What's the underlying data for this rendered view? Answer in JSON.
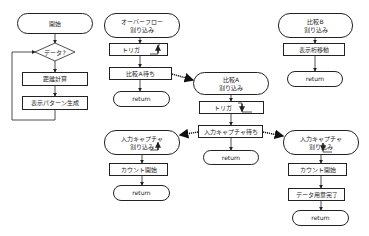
{
  "diagram": {
    "type": "flowchart",
    "colors": {
      "line": "#222222",
      "background": "#ffffff",
      "dotted_arrow": "#222222"
    },
    "main_flow": {
      "start": "開始",
      "decision": "データ?",
      "steps": [
        "距離計算",
        "表示パターン生成"
      ]
    },
    "overflow_isr": {
      "title": "オーバーフロー\n割り込み",
      "trigger": "トリガ",
      "wait": "比較A待ち",
      "end": "return"
    },
    "compare_a_isr": {
      "title": "比較A\n割り込み",
      "trigger": "トリガ",
      "wait": "入力キャプチャ待ち",
      "end": "return"
    },
    "compare_b_isr": {
      "title": "比較B\n割り込み",
      "step": "表示桁移動",
      "end": "return"
    },
    "capture_isr_left": {
      "title": "入力キャプチャ\n割り込み",
      "step": "カウント開始",
      "end": "return"
    },
    "capture_isr_right": {
      "title": "入力キャプチャ\n割り込み",
      "steps": [
        "カウント開始",
        "データ用意完了"
      ],
      "end": "return"
    }
  }
}
